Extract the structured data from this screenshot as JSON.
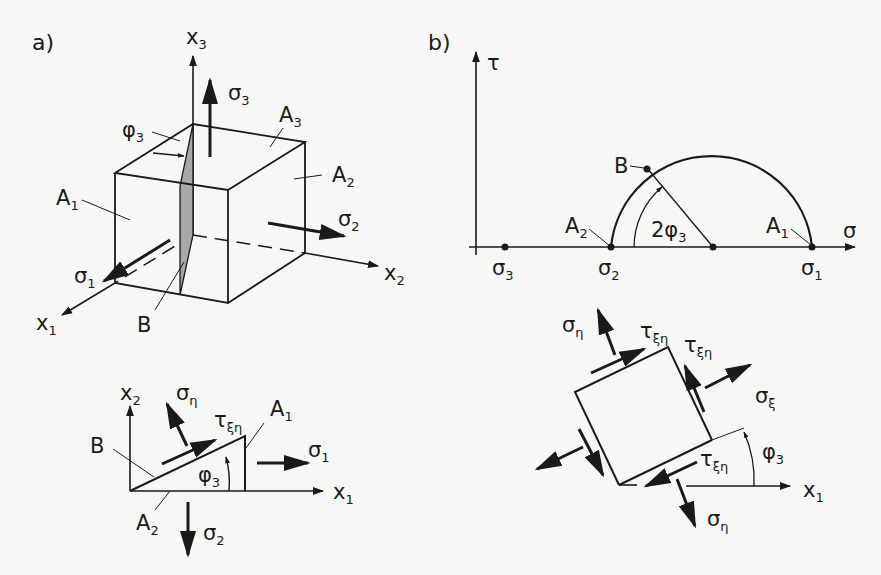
{
  "panel_a": {
    "label": "a)",
    "cube": {
      "axes": {
        "x1": {
          "base": "x",
          "sub": "1"
        },
        "x2": {
          "base": "x",
          "sub": "2"
        },
        "x3": {
          "base": "x",
          "sub": "3"
        }
      },
      "stresses": {
        "sigma1": {
          "base": "σ",
          "sub": "1"
        },
        "sigma2": {
          "base": "σ",
          "sub": "2"
        },
        "sigma3": {
          "base": "σ",
          "sub": "3"
        }
      },
      "faces": {
        "A1": {
          "base": "A",
          "sub": "1"
        },
        "A2": {
          "base": "A",
          "sub": "2"
        },
        "A3": {
          "base": "A",
          "sub": "3"
        }
      },
      "angle": {
        "base": "φ",
        "sub": "3"
      },
      "plane": "B",
      "plane_fill": "#a8a8a8"
    },
    "triangle": {
      "axes": {
        "x1": {
          "base": "x",
          "sub": "1"
        },
        "x2": {
          "base": "x",
          "sub": "2"
        }
      },
      "stresses": {
        "sigma_eta": {
          "base": "σ",
          "sub": "η"
        },
        "tau_xi_eta": {
          "base": "τ",
          "sub": "ξη"
        },
        "sigma1": {
          "base": "σ",
          "sub": "1"
        },
        "sigma2": {
          "base": "σ",
          "sub": "2"
        }
      },
      "faces": {
        "A1": {
          "base": "A",
          "sub": "1"
        },
        "A2": {
          "base": "A",
          "sub": "2"
        }
      },
      "plane": "B",
      "angle": {
        "base": "φ",
        "sub": "3"
      }
    }
  },
  "panel_b": {
    "label": "b)",
    "mohr": {
      "axis_x": "σ",
      "axis_y": "τ",
      "points": {
        "sigma3": {
          "base": "σ",
          "sub": "3"
        },
        "sigma2": {
          "base": "σ",
          "sub": "2"
        },
        "sigma1": {
          "base": "σ",
          "sub": "1"
        }
      },
      "A1": {
        "base": "A",
        "sub": "1"
      },
      "A2": {
        "base": "A",
        "sub": "2"
      },
      "B": "B",
      "angle": {
        "prefix": "2φ",
        "sub": "3"
      }
    },
    "element": {
      "stresses": {
        "sigma_eta_top": {
          "base": "σ",
          "sub": "η"
        },
        "sigma_eta_bottom": {
          "base": "σ",
          "sub": "η"
        },
        "sigma_xi": {
          "base": "σ",
          "sub": "ξ"
        },
        "tau_top": {
          "base": "τ",
          "sub": "ξη"
        },
        "tau_right": {
          "base": "τ",
          "sub": "ξη"
        },
        "tau_bottom": {
          "base": "τ",
          "sub": "ξη"
        }
      },
      "axis_x1": {
        "base": "x",
        "sub": "1"
      },
      "angle": {
        "base": "φ",
        "sub": "3"
      }
    }
  },
  "colors": {
    "background": "#f7f7f5",
    "ink": "#1a1a1a",
    "plane_shade": "#a8a8a8"
  }
}
